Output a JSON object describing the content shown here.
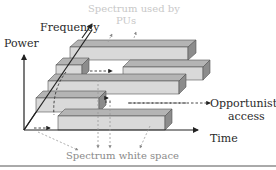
{
  "diagram": {
    "axes": {
      "power": "Power",
      "frequency": "Frequency",
      "time": "Time"
    },
    "annotations": {
      "spectrum_used_line1": "Spectrum used by",
      "spectrum_used_line2": "PUs",
      "opportunistic_line1": "Opportunistic",
      "opportunistic_line2": "access",
      "white_space": "Spectrum white space"
    },
    "colors": {
      "block_front": "#d9d9d9",
      "block_top": "#b4b4b4",
      "block_side": "#8c8c8c",
      "axis": "#222222",
      "faded_text": "#c8c8c8"
    }
  }
}
